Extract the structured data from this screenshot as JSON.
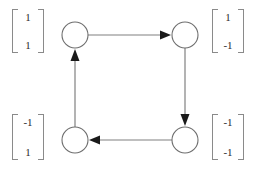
{
  "figure": {
    "type": "directed-cycle-graph",
    "background_color": "#ffffff",
    "edge_color": "#808080",
    "node_stroke_color": "#6e6e6e",
    "node_fill_color": "#ffffff",
    "arrowhead_color": "#1a1a1a",
    "text_color": "#2b2b2b"
  },
  "nodes": [
    {
      "id": "top-left",
      "cx": 75,
      "cy": 35,
      "r": 13
    },
    {
      "id": "top-right",
      "cx": 185,
      "cy": 35,
      "r": 13
    },
    {
      "id": "bottom-right",
      "cx": 185,
      "cy": 140,
      "r": 13
    },
    {
      "id": "bottom-left",
      "cx": 75,
      "cy": 140,
      "r": 13
    }
  ],
  "edges": [
    {
      "id": "edge-top",
      "from": "top-left",
      "to": "top-right",
      "direction": "right"
    },
    {
      "id": "edge-right",
      "from": "top-right",
      "to": "bottom-right",
      "direction": "down"
    },
    {
      "id": "edge-bottom",
      "from": "bottom-right",
      "to": "bottom-left",
      "direction": "left"
    },
    {
      "id": "edge-left",
      "from": "bottom-left",
      "to": "top-left",
      "direction": "up"
    }
  ],
  "labels": {
    "top_left": {
      "entries": [
        "1",
        "1"
      ]
    },
    "top_right": {
      "entries": [
        "1",
        "-1"
      ]
    },
    "bottom_left": {
      "entries": [
        "-1",
        "1"
      ]
    },
    "bottom_right": {
      "entries": [
        "-1",
        "-1"
      ]
    }
  }
}
